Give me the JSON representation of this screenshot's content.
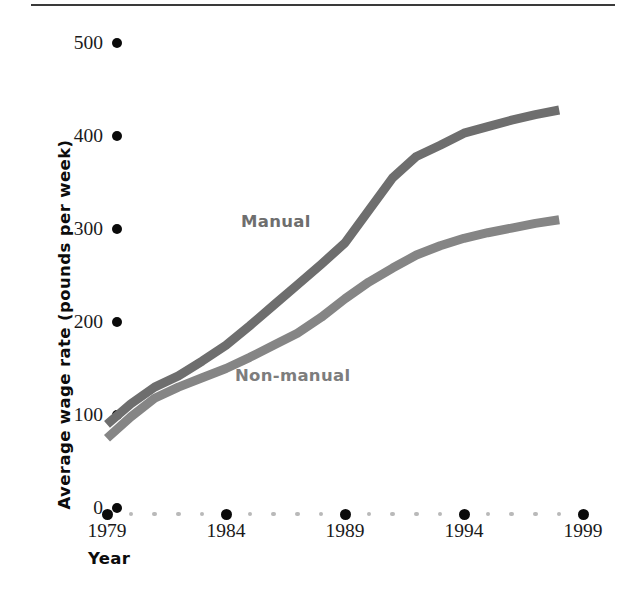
{
  "chart_data": {
    "type": "line",
    "title": "",
    "subtitle": "",
    "xlabel": "Year",
    "ylabel": "Average wage rate (pounds per week)",
    "xlim": [
      1979,
      1999
    ],
    "ylim": [
      0,
      500
    ],
    "grid": false,
    "legend_position": "inline-annotation",
    "x_tick_labels": [
      "1979",
      "1984",
      "1989",
      "1994",
      "1999"
    ],
    "x_major_ticks": [
      1979,
      1984,
      1989,
      1994,
      1999
    ],
    "x_minor_ticks": [
      1980,
      1981,
      1982,
      1983,
      1985,
      1986,
      1987,
      1988,
      1990,
      1991,
      1992,
      1993,
      1995,
      1996,
      1997,
      1998
    ],
    "y_tick_labels": [
      "0",
      "100",
      "200",
      "300",
      "400",
      "500"
    ],
    "y_ticks": [
      0,
      100,
      200,
      300,
      400,
      500
    ],
    "x": [
      1979,
      1980,
      1981,
      1982,
      1983,
      1984,
      1985,
      1986,
      1987,
      1988,
      1989,
      1990,
      1991,
      1992,
      1993,
      1994,
      1995,
      1996,
      1997,
      1998
    ],
    "series": [
      {
        "name": "Manual",
        "color": "#6e6e6e",
        "values": [
          90,
          112,
          130,
          142,
          158,
          175,
          196,
          218,
          240,
          262,
          285,
          320,
          355,
          378,
          390,
          403,
          410,
          417,
          423,
          428
        ]
      },
      {
        "name": "Non-manual",
        "color": "#858585",
        "values": [
          75,
          98,
          118,
          130,
          140,
          150,
          162,
          175,
          188,
          205,
          225,
          243,
          258,
          272,
          282,
          290,
          296,
          301,
          306,
          310
        ]
      }
    ],
    "annotations": [
      {
        "text": "Manual",
        "x": 1984.5,
        "y": 310
      },
      {
        "text": "Non-manual",
        "x": 1984.2,
        "y": 143
      }
    ]
  },
  "axes": {
    "y_title": "Average wage rate (pounds per week)",
    "x_title": "Year",
    "y_tick_labels": [
      "500",
      "400",
      "300",
      "200",
      "100",
      "0"
    ],
    "x_tick_labels": [
      "1979",
      "1984",
      "1989",
      "1994",
      "1999"
    ]
  },
  "colors": {
    "manual_line": "#6e6e6e",
    "nonmanual_line": "#858585",
    "tick_dot_major": "#0a0a0a",
    "tick_dot_minor": "#b9b9b9",
    "rule": "#3a3a3a",
    "text": "#1a1a1a"
  }
}
